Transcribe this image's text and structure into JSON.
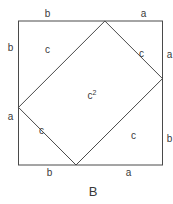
{
  "diagram": {
    "caption": "B",
    "outer_square": {
      "top_labels": [
        "b",
        "a"
      ],
      "right_labels": [
        "a",
        "b"
      ],
      "bottom_labels": [
        "b",
        "a"
      ],
      "left_labels": [
        "b",
        "a"
      ]
    },
    "inner_square": {
      "edge_labels": [
        "c",
        "c",
        "c",
        "c"
      ],
      "area_label": "c",
      "area_exponent": "2"
    },
    "proportions": {
      "a": 0.4,
      "b": 0.6
    },
    "colors": {
      "line": "#4a4a4a",
      "text": "#3a3a3a",
      "background": "#ffffff"
    }
  }
}
